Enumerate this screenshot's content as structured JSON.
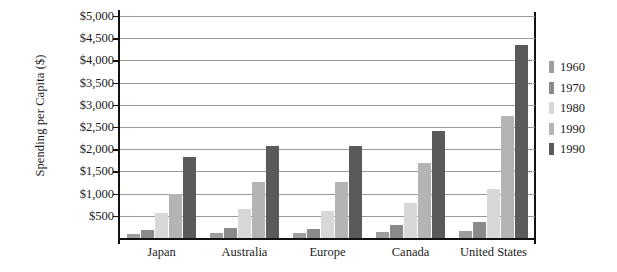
{
  "chart_data": {
    "type": "bar",
    "title": "",
    "subtitle": "",
    "xlabel": "",
    "ylabel": "Spending per Capita ($)",
    "ylim": [
      0,
      5000
    ],
    "ytick_step": 500,
    "ytick_labels": [
      "$5,000",
      "$4,500",
      "$4,000",
      "$3,500",
      "$3,000",
      "$2,500",
      "$2,000",
      "$1,500",
      "$1,000",
      "$500"
    ],
    "ytick_values": [
      5000,
      4500,
      4000,
      3500,
      3000,
      2500,
      2000,
      1500,
      1000,
      500
    ],
    "grid": true,
    "legend_position": "right",
    "categories": [
      "Japan",
      "Australia",
      "Europe",
      "Canada",
      "United States"
    ],
    "series": [
      {
        "name": "1960",
        "color": "#9e9e9e",
        "values": [
          100,
          120,
          110,
          140,
          150
        ]
      },
      {
        "name": "1970",
        "color": "#8a8a8a",
        "values": [
          190,
          230,
          210,
          290,
          350
        ]
      },
      {
        "name": "1980",
        "color": "#d8d8d8",
        "values": [
          560,
          660,
          600,
          780,
          1100
        ]
      },
      {
        "name": "1990",
        "color": "#b4b4b4",
        "values": [
          1000,
          1270,
          1270,
          1700,
          2750
        ]
      },
      {
        "name": "1990",
        "color": "#5a5a5a",
        "values": [
          1830,
          2080,
          2080,
          2400,
          4350
        ]
      }
    ]
  },
  "legend": {
    "items": [
      {
        "label": "1960",
        "color": "#9e9e9e"
      },
      {
        "label": "1970",
        "color": "#8a8a8a"
      },
      {
        "label": "1980",
        "color": "#d8d8d8"
      },
      {
        "label": "1990",
        "color": "#b4b4b4"
      },
      {
        "label": "1990",
        "color": "#5a5a5a"
      }
    ]
  },
  "colors": {
    "axis": "#111111",
    "gridline": "#9a9a9a",
    "background": "#ffffff",
    "text": "#1a1a1a"
  }
}
